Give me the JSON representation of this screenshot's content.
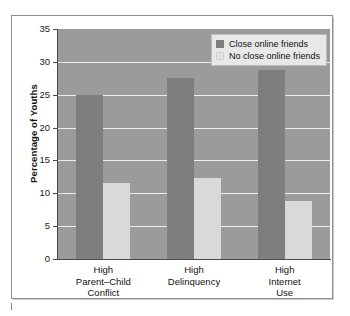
{
  "chart_data": {
    "type": "bar",
    "title": "",
    "subtitle": "",
    "xlabel": "",
    "ylabel": "Percentage of Youths",
    "ylim": [
      0,
      35
    ],
    "ytick_step": 5,
    "yticks": [
      "35",
      "30",
      "25",
      "20",
      "15",
      "10",
      "5",
      "0"
    ],
    "ytick_values": [
      35,
      30,
      25,
      20,
      15,
      10,
      5,
      0
    ],
    "grid": true,
    "grid_axis": "y",
    "legend_position": "top-right",
    "categories": [
      "High\nParent–Child\nConflict",
      "High\nDelinquency",
      "High\nInternet\nUse"
    ],
    "category_labels_flat": [
      "High Parent–Child Conflict",
      "High Delinquency",
      "High Internet Use"
    ],
    "series": [
      {
        "name": "Close online friends",
        "color": "#7e7e7e",
        "values": [
          25.0,
          27.5,
          28.7
        ]
      },
      {
        "name": "No close online friends",
        "color": "#d9d9d9",
        "values": [
          11.5,
          12.3,
          8.8
        ]
      }
    ],
    "plot_background": "#9b9b9b",
    "gridline_color": "#efefef",
    "axis_color": "#4a4a4a",
    "figure_background": "#ffffff"
  },
  "legend": {
    "items": [
      {
        "label": "Close online friends",
        "swatch": "series-a"
      },
      {
        "label": "No close online friends",
        "swatch": "series-b"
      }
    ]
  },
  "axis": {
    "y_title": "Percentage of Youths"
  }
}
